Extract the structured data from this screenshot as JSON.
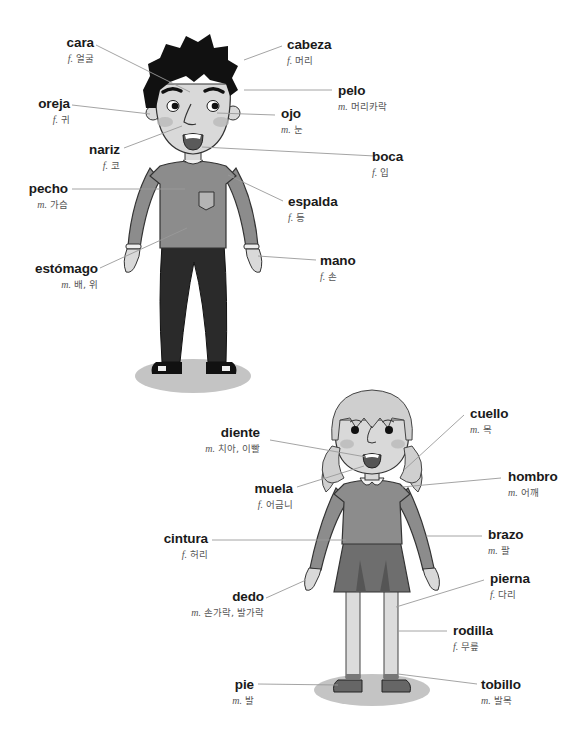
{
  "boy": {
    "labels": [
      {
        "id": "cara",
        "es": "cara",
        "gender": "f.",
        "ko": "얼굴"
      },
      {
        "id": "cabeza",
        "es": "cabeza",
        "gender": "f.",
        "ko": "머리"
      },
      {
        "id": "pelo",
        "es": "pelo",
        "gender": "m.",
        "ko": "머리카락"
      },
      {
        "id": "oreja",
        "es": "oreja",
        "gender": "f.",
        "ko": "귀"
      },
      {
        "id": "ojo",
        "es": "ojo",
        "gender": "m.",
        "ko": "눈"
      },
      {
        "id": "nariz",
        "es": "nariz",
        "gender": "f.",
        "ko": "코"
      },
      {
        "id": "boca",
        "es": "boca",
        "gender": "f.",
        "ko": "입"
      },
      {
        "id": "pecho",
        "es": "pecho",
        "gender": "m.",
        "ko": "가슴"
      },
      {
        "id": "espalda",
        "es": "espalda",
        "gender": "f.",
        "ko": "등"
      },
      {
        "id": "estomago",
        "es": "estómago",
        "gender": "m.",
        "ko": "배, 위"
      },
      {
        "id": "mano",
        "es": "mano",
        "gender": "f.",
        "ko": "손"
      }
    ]
  },
  "girl": {
    "labels": [
      {
        "id": "diente",
        "es": "diente",
        "gender": "m.",
        "ko": "치아, 이빨"
      },
      {
        "id": "cuello",
        "es": "cuello",
        "gender": "m.",
        "ko": "목"
      },
      {
        "id": "muela",
        "es": "muela",
        "gender": "f.",
        "ko": "어금니"
      },
      {
        "id": "hombro",
        "es": "hombro",
        "gender": "m.",
        "ko": "어깨"
      },
      {
        "id": "cintura",
        "es": "cintura",
        "gender": "f.",
        "ko": "허리"
      },
      {
        "id": "brazo",
        "es": "brazo",
        "gender": "m.",
        "ko": "팔"
      },
      {
        "id": "dedo",
        "es": "dedo",
        "gender": "m.",
        "ko": "손가락, 발가락"
      },
      {
        "id": "pierna",
        "es": "pierna",
        "gender": "f.",
        "ko": "다리"
      },
      {
        "id": "rodilla",
        "es": "rodilla",
        "gender": "f.",
        "ko": "무릎"
      },
      {
        "id": "pie",
        "es": "pie",
        "gender": "m.",
        "ko": "발"
      },
      {
        "id": "tobillo",
        "es": "tobillo",
        "gender": "m.",
        "ko": "발목"
      }
    ]
  },
  "colors": {
    "leader_line": "#9a9a9a",
    "label_text": "#1a1a1a",
    "subtext": "#555555",
    "skin": "#d9d9d9",
    "hair_boy": "#111111",
    "shirt": "#8c8c8c",
    "pants": "#2a2a2a",
    "shadow": "#c4c4c4",
    "hair_girl": "#cfcfcf",
    "skirt": "#6e6e6e",
    "legs_girl": "#dcdcdc"
  }
}
